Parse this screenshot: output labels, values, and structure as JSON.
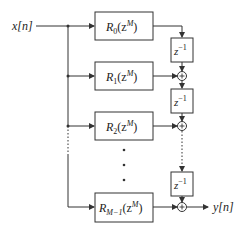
{
  "diagram": {
    "type": "polyphase-filter-structure",
    "input_label": "x[n]",
    "output_label": "y[n]",
    "branches": [
      {
        "name": "R",
        "sub": "0",
        "arg": "(z",
        "exp": "M",
        "close": ")"
      },
      {
        "name": "R",
        "sub": "1",
        "arg": "(z",
        "exp": "M",
        "close": ")"
      },
      {
        "name": "R",
        "sub": "2",
        "arg": "(z",
        "exp": "M",
        "close": ")"
      },
      {
        "name": "R",
        "sub": "M−1",
        "arg": "(z",
        "exp": "M",
        "close": ")"
      }
    ],
    "delays": [
      {
        "base": "z",
        "exp": "−1"
      },
      {
        "base": "z",
        "exp": "−1"
      },
      {
        "base": "z",
        "exp": "−1"
      }
    ],
    "adder_symbol": "+",
    "ellipsis": "•"
  },
  "colors": {
    "stroke": "#333333",
    "background": "#ffffff"
  }
}
